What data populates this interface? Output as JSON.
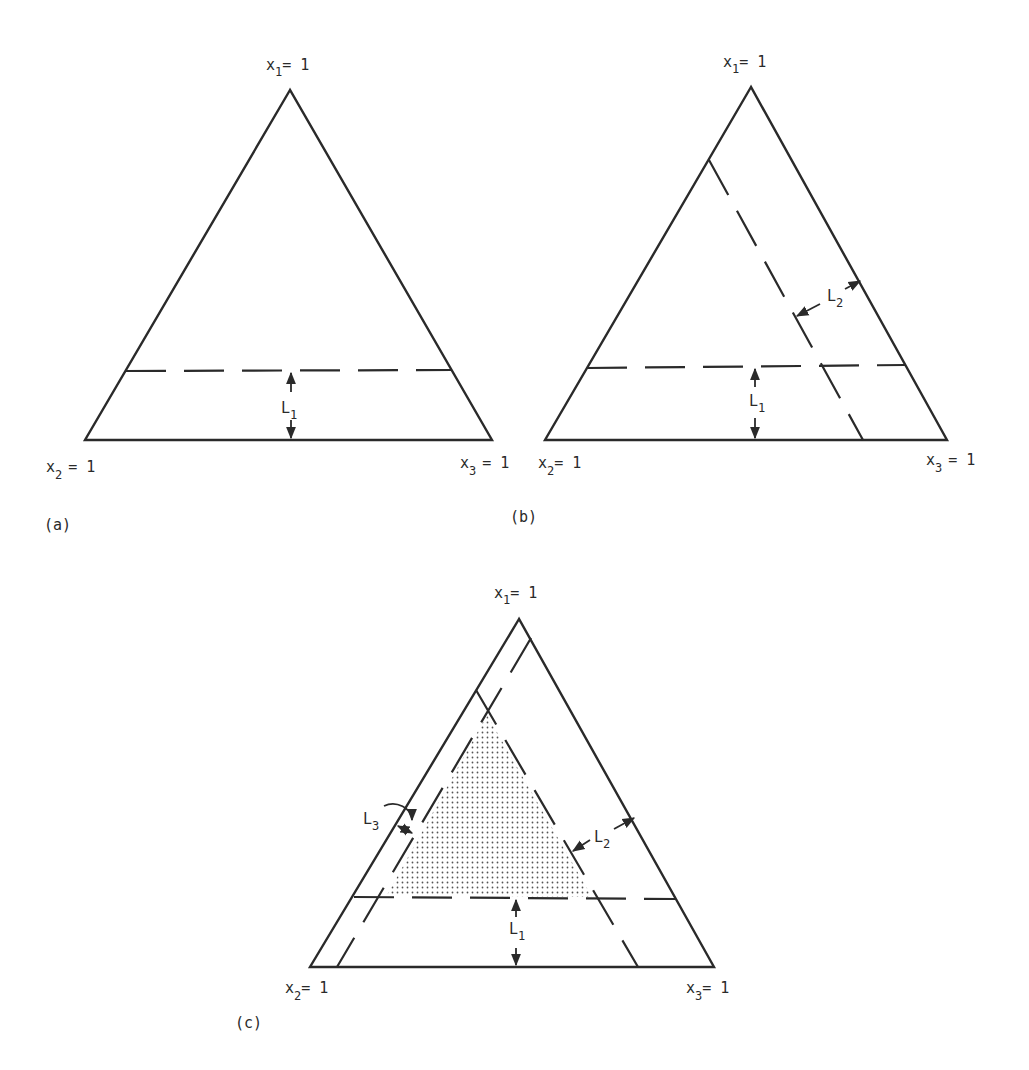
{
  "figure": {
    "panels": [
      {
        "id": "a",
        "caption": "(a)",
        "vertex_top": {
          "var": "x",
          "sub": "1",
          "eq": "= 1"
        },
        "vertex_left": {
          "var": "x",
          "sub": "2",
          "eq": "= 1"
        },
        "vertex_right": {
          "var": "x",
          "sub": "3",
          "eq": "= 1"
        },
        "constraints": [
          {
            "label": "L",
            "sub": "1"
          }
        ]
      },
      {
        "id": "b",
        "caption": "(b)",
        "vertex_top": {
          "var": "x",
          "sub": "1",
          "eq": "= 1"
        },
        "vertex_left": {
          "var": "x",
          "sub": "2",
          "eq": "= 1"
        },
        "vertex_right": {
          "var": "x",
          "sub": "3",
          "eq": "= 1"
        },
        "constraints": [
          {
            "label": "L",
            "sub": "1"
          },
          {
            "label": "L",
            "sub": "2"
          }
        ]
      },
      {
        "id": "c",
        "caption": "(c)",
        "vertex_top": {
          "var": "x",
          "sub": "1",
          "eq": "= 1"
        },
        "vertex_left": {
          "var": "x",
          "sub": "2",
          "eq": "= 1"
        },
        "vertex_right": {
          "var": "x",
          "sub": "3",
          "eq": "= 1"
        },
        "constraints": [
          {
            "label": "L",
            "sub": "1"
          },
          {
            "label": "L",
            "sub": "2"
          },
          {
            "label": "L",
            "sub": "3"
          }
        ],
        "shaded_region": "feasible region bounded by L1, L2, L3"
      }
    ]
  },
  "colors": {
    "ink": "#2a2a2a",
    "background": "#ffffff"
  }
}
